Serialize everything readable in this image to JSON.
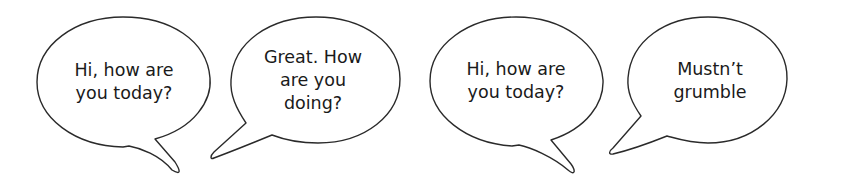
{
  "bubbles": [
    {
      "id": "b1",
      "text": "Hi, how are\nyou today?",
      "cx": 124,
      "cy": 82
    },
    {
      "id": "b2",
      "text": "Great. How\nare you\ndoing?",
      "cx": 313,
      "cy": 80
    },
    {
      "id": "b3",
      "text": "Hi, how are\nyou today?",
      "cx": 516,
      "cy": 81
    },
    {
      "id": "b4",
      "text": "Mustn’t\ngrumble",
      "cx": 710,
      "cy": 81
    }
  ],
  "colors": {
    "stroke": "#2a2a2a",
    "fill": "#ffffff",
    "text": "#1a1a1a"
  }
}
